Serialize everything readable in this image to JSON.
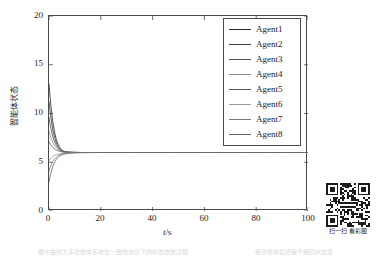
{
  "figure": {
    "background_color": "#ffffff",
    "axis_color": "#4a4a4a"
  },
  "axes": {
    "x_label_symbol": "t",
    "x_label_unit": "/s",
    "y_label": "智能体状态",
    "x_ticks": [
      "0",
      "20",
      "40",
      "60",
      "80",
      "100"
    ],
    "y_ticks": [
      "0",
      "5",
      "10",
      "15",
      "20"
    ]
  },
  "legend": {
    "items": [
      {
        "label": "Agent1",
        "color": "#2b2b2b"
      },
      {
        "label": "Agent2",
        "color": "#3d3d3d"
      },
      {
        "label": "Agent3",
        "color": "#4f4f4f"
      },
      {
        "label": "Agent4",
        "color": "#8c8c8c"
      },
      {
        "label": "Agent5",
        "color": "#5a5a5a"
      },
      {
        "label": "Agent6",
        "color": "#9a9a9a"
      },
      {
        "label": "Agent7",
        "color": "#787878"
      },
      {
        "label": "Agent8",
        "color": "#666666"
      }
    ]
  },
  "qr": {
    "caption": "扫一扫 看彩图"
  },
  "page_bleed": {
    "left_text": "图中曲线为多智能体系统在一致性协议下的状态收敛过程",
    "right_text": "各智能体最终趋于相同状态值"
  },
  "chart_data": {
    "type": "line",
    "title": "",
    "xlabel": "t/s",
    "ylabel": "智能体状态",
    "xlim": [
      0,
      100
    ],
    "ylim": [
      0,
      20
    ],
    "xticks": [
      0,
      20,
      40,
      60,
      80,
      100
    ],
    "yticks": [
      0,
      5,
      10,
      15,
      20
    ],
    "grid": false,
    "legend_position": "upper right",
    "consensus_value": 6.0,
    "settling_time_s": 15,
    "x": [
      0,
      0.5,
      1,
      1.5,
      2,
      3,
      4,
      5,
      6,
      8,
      10,
      12,
      15,
      20,
      30,
      40,
      50,
      60,
      70,
      80,
      90,
      100
    ],
    "series": [
      {
        "name": "Agent1",
        "color": "#2b2b2b",
        "initial_value": 13.0,
        "values": [
          13.0,
          10.6,
          9.0,
          7.95,
          7.3,
          6.62,
          6.31,
          6.16,
          6.09,
          6.03,
          6.01,
          6.0,
          6.0,
          6.0,
          6.0,
          6.0,
          6.0,
          6.0,
          6.0,
          6.0,
          6.0,
          6.0
        ]
      },
      {
        "name": "Agent2",
        "color": "#3d3d3d",
        "initial_value": 11.2,
        "values": [
          11.2,
          9.45,
          8.25,
          7.48,
          7.0,
          6.48,
          6.24,
          6.12,
          6.07,
          6.02,
          6.01,
          6.0,
          6.0,
          6.0,
          6.0,
          6.0,
          6.0,
          6.0,
          6.0,
          6.0,
          6.0,
          6.0
        ]
      },
      {
        "name": "Agent3",
        "color": "#4f4f4f",
        "initial_value": 9.6,
        "values": [
          9.6,
          8.42,
          7.6,
          7.07,
          6.74,
          6.38,
          6.2,
          6.1,
          6.05,
          6.02,
          6.01,
          6.0,
          6.0,
          6.0,
          6.0,
          6.0,
          6.0,
          6.0,
          6.0,
          6.0,
          6.0,
          6.0
        ]
      },
      {
        "name": "Agent4",
        "color": "#8c8c8c",
        "initial_value": 8.2,
        "values": [
          8.2,
          7.55,
          7.08,
          6.76,
          6.56,
          6.31,
          6.17,
          6.09,
          6.05,
          6.02,
          6.0,
          6.0,
          6.0,
          6.0,
          6.0,
          6.0,
          6.0,
          6.0,
          6.0,
          6.0,
          6.0,
          6.0
        ]
      },
      {
        "name": "Agent5",
        "color": "#5a5a5a",
        "initial_value": 7.1,
        "values": [
          7.1,
          6.82,
          6.6,
          6.44,
          6.33,
          6.19,
          6.11,
          6.06,
          6.03,
          6.01,
          6.0,
          6.0,
          6.0,
          6.0,
          6.0,
          6.0,
          6.0,
          6.0,
          6.0,
          6.0,
          6.0,
          6.0
        ]
      },
      {
        "name": "Agent6",
        "color": "#9a9a9a",
        "initial_value": 5.2,
        "values": [
          5.2,
          5.36,
          5.5,
          5.6,
          5.67,
          5.78,
          5.86,
          5.91,
          5.94,
          5.98,
          5.99,
          6.0,
          6.0,
          6.0,
          6.0,
          6.0,
          6.0,
          6.0,
          6.0,
          6.0,
          6.0,
          6.0
        ]
      },
      {
        "name": "Agent7",
        "color": "#787878",
        "initial_value": 4.1,
        "values": [
          4.1,
          4.55,
          4.92,
          5.2,
          5.4,
          5.62,
          5.76,
          5.85,
          5.9,
          5.96,
          5.98,
          5.99,
          6.0,
          6.0,
          6.0,
          6.0,
          6.0,
          6.0,
          6.0,
          6.0,
          6.0,
          6.0
        ]
      },
      {
        "name": "Agent8",
        "color": "#666666",
        "initial_value": 3.0,
        "values": [
          3.0,
          3.72,
          4.3,
          4.75,
          5.1,
          5.45,
          5.65,
          5.78,
          5.85,
          5.93,
          5.97,
          5.98,
          5.99,
          6.0,
          6.0,
          6.0,
          6.0,
          6.0,
          6.0,
          6.0,
          6.0,
          6.0
        ]
      }
    ]
  }
}
